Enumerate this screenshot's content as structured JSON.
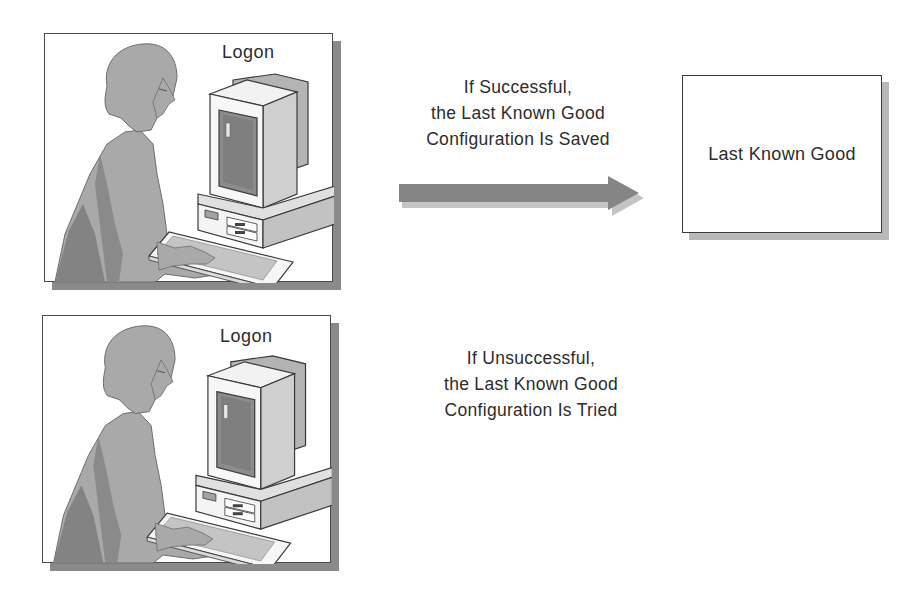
{
  "diagram": {
    "top_panel": {
      "label": "Logon",
      "illustration": "person-at-computer"
    },
    "bottom_panel": {
      "label": "Logon",
      "illustration": "person-at-computer"
    },
    "success_caption": {
      "line1": "If Successful,",
      "line2": "the Last Known Good",
      "line3": "Configuration Is Saved"
    },
    "failure_caption": {
      "line1": "If Unsuccessful,",
      "line2": "the Last Known Good",
      "line3": "Configuration Is Tried"
    },
    "target_box": {
      "label": "Last Known Good"
    },
    "arrow": {
      "direction": "right",
      "icon": "arrow-right-icon"
    },
    "colors": {
      "figure_gray": "#a8a8a8",
      "dark_gray": "#7a7a7a",
      "screen": "#8c8c8c",
      "outline": "#3a3a3a",
      "shadow": "#8a8a8a",
      "arrow": "#858585"
    }
  }
}
